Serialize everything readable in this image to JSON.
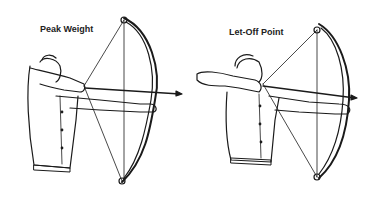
{
  "figure": {
    "panels": [
      {
        "id": "peak-weight",
        "label": "Peak Weight"
      },
      {
        "id": "let-off-point",
        "label": "Let-Off Point"
      }
    ],
    "colors": {
      "line": "#1a1a1a",
      "background": "#ffffff"
    }
  }
}
